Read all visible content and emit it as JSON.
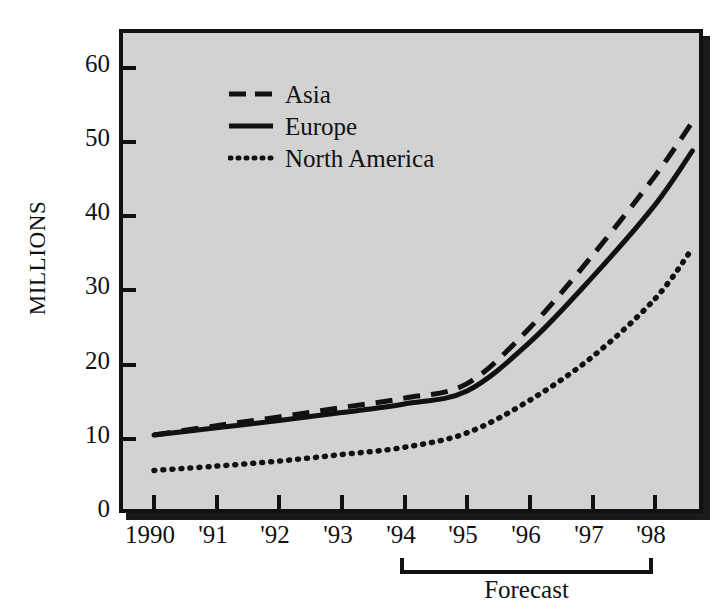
{
  "chart_data": {
    "type": "line",
    "title": "",
    "subtitle": "",
    "xlabel": "",
    "ylabel": "MILLIONS",
    "categories": [
      "1990",
      "'91",
      "'92",
      "'93",
      "'94",
      "'95",
      "'96",
      "'97",
      "'98"
    ],
    "x": [
      1990,
      1991,
      1992,
      1993,
      1994,
      1995,
      1996,
      1997,
      1998
    ],
    "xlim": [
      1990,
      1998.6
    ],
    "ylim": [
      0,
      65
    ],
    "yticks": [
      0,
      10,
      20,
      30,
      40,
      50,
      60
    ],
    "ytick_labels": [
      "0",
      "10",
      "20",
      "30",
      "40",
      "50",
      "60"
    ],
    "grid": false,
    "legend_position": "top-left-inside",
    "series": [
      {
        "name": "Asia",
        "style": "dashed",
        "color": "#111111",
        "values": [
          11.2,
          12.5,
          13.7,
          15.0,
          16.3,
          18.3,
          26.0,
          36.0,
          47.0
        ],
        "extended_end_x": 1998.6,
        "extended_end_value": 54.5
      },
      {
        "name": "Europe",
        "style": "solid",
        "color": "#111111",
        "values": [
          11.2,
          12.2,
          13.2,
          14.3,
          15.5,
          17.3,
          24.0,
          33.0,
          43.0
        ],
        "extended_end_x": 1998.6,
        "extended_end_value": 50.5
      },
      {
        "name": "North America",
        "style": "dotted",
        "color": "#111111",
        "values": [
          6.3,
          6.9,
          7.6,
          8.5,
          9.5,
          11.5,
          16.0,
          22.0,
          30.0
        ],
        "extended_end_x": 1998.6,
        "extended_end_value": 37.0
      }
    ],
    "annotations": [
      {
        "name": "forecast-bracket",
        "label": "Forecast",
        "from_category": "'94",
        "to_category": "'98"
      }
    ],
    "plot_background_color": "#d2d2d2",
    "frame_color": "#111111"
  },
  "legend": {
    "entries": [
      {
        "label": "Asia",
        "style": "dashed"
      },
      {
        "label": "Europe",
        "style": "solid"
      },
      {
        "label": "North America",
        "style": "dotted"
      }
    ]
  },
  "axes": {
    "y_title": "MILLIONS",
    "y_labels": [
      "60",
      "50",
      "40",
      "30",
      "20",
      "10",
      "0"
    ],
    "x_labels": [
      "1990",
      "'91",
      "'92",
      "'93",
      "'94",
      "'95",
      "'96",
      "'97",
      "'98"
    ]
  },
  "forecast": {
    "label": "Forecast"
  }
}
